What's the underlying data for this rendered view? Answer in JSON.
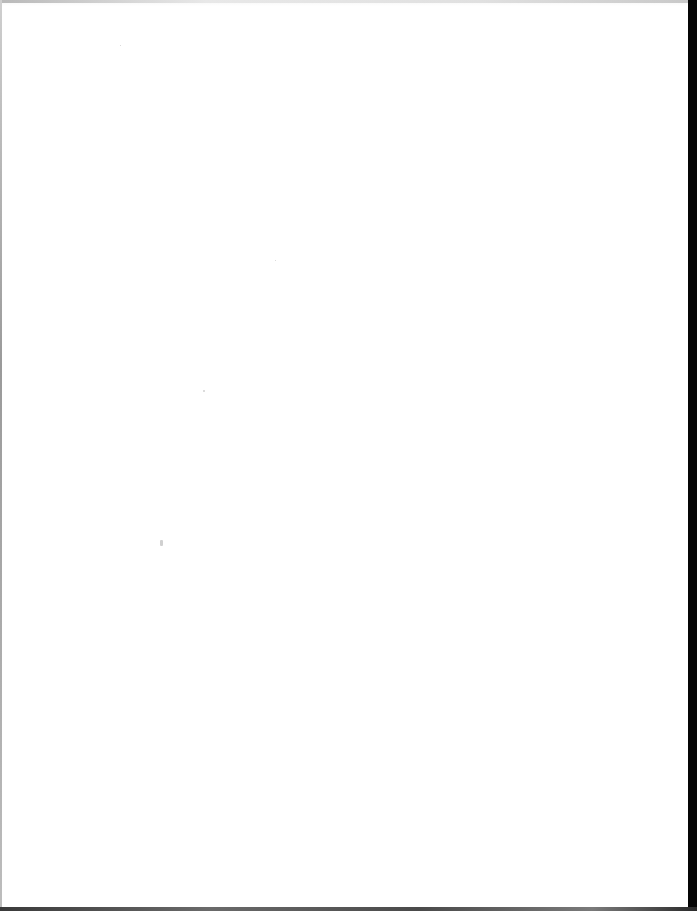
{
  "document": {
    "type": "scanned-page",
    "content_text": "",
    "background_color": "#ffffff",
    "edges": {
      "left": "#9a9a9a",
      "right": "#050505",
      "bottom": "#4a4a4a"
    }
  }
}
